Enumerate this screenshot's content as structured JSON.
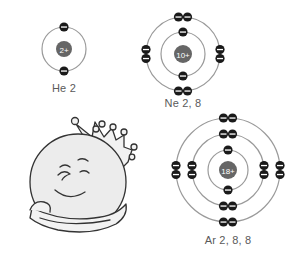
{
  "colors": {
    "background": "#ffffff",
    "orbit": "#9a9a9a",
    "nucleus": "#666666",
    "nucleus_text": "#ffffff",
    "electron": "#1a1a1a",
    "label": "#5a5a5a",
    "cartoon_fill": "#ececec",
    "cartoon_line": "#333333"
  },
  "atoms": [
    {
      "symbol": "He",
      "label": "He 2",
      "nucleus_charge": "2+",
      "shells": [
        2
      ],
      "center": [
        64,
        49
      ],
      "label_pos": [
        64,
        82
      ]
    },
    {
      "symbol": "Ne",
      "label": "Ne 2, 8",
      "nucleus_charge": "10+",
      "shells": [
        2,
        8
      ],
      "center": [
        183,
        54
      ],
      "label_pos": [
        183,
        97
      ]
    },
    {
      "symbol": "Ar",
      "label": "Ar 2, 8, 8",
      "nucleus_charge": "18+",
      "shells": [
        2,
        8,
        8
      ],
      "center": [
        228,
        170
      ],
      "label_pos": [
        228,
        234
      ]
    }
  ],
  "cartoon": {
    "description": "smiling crowned sphere with crossed arms (noble gas mascot)"
  }
}
